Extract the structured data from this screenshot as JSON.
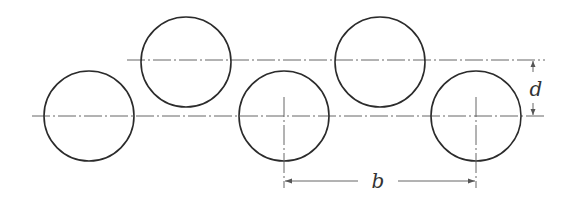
{
  "diagram": {
    "title": "",
    "circles": [
      {
        "id": "circle-1",
        "row": "lower"
      },
      {
        "id": "circle-2",
        "row": "upper"
      },
      {
        "id": "circle-3",
        "row": "lower"
      },
      {
        "id": "circle-4",
        "row": "upper"
      },
      {
        "id": "circle-5",
        "row": "lower"
      }
    ],
    "dimensions": {
      "row_spacing_label": "d",
      "pitch_label": "b"
    },
    "colors": {
      "stroke": "#2b2b2b",
      "dim": "#555555",
      "background": "#ffffff"
    }
  }
}
